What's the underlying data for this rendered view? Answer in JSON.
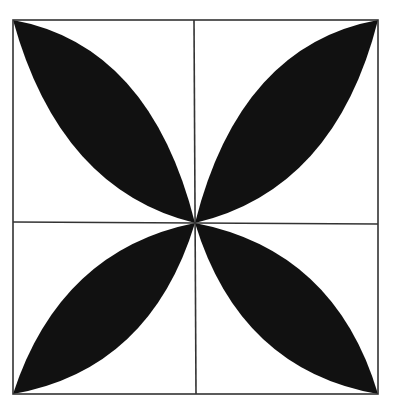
{
  "figure": {
    "colors": {
      "background": "#ffffff",
      "fill": "#111111",
      "stroke": "#333333"
    },
    "square": {
      "left": 13,
      "top": 20,
      "right": 378,
      "bottom": 394
    },
    "center": {
      "x": 195,
      "y": 223
    },
    "leaves": [
      {
        "name": "top-left"
      },
      {
        "name": "top-right"
      },
      {
        "name": "bottom-left"
      },
      {
        "name": "bottom-right"
      }
    ]
  }
}
